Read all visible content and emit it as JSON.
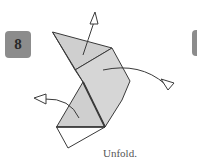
{
  "step": {
    "number": "8",
    "caption": "Unfold."
  },
  "colors": {
    "badge": "#8c8c8c",
    "paper_fill": "#cfcfcf",
    "paper_fill_light": "#d9d9d9",
    "stroke": "#3a3a3a"
  },
  "icons": {
    "arrow_up": "unfold-arrow-up-icon",
    "arrow_right": "unfold-arrow-right-icon",
    "arrow_left": "unfold-arrow-left-icon"
  }
}
